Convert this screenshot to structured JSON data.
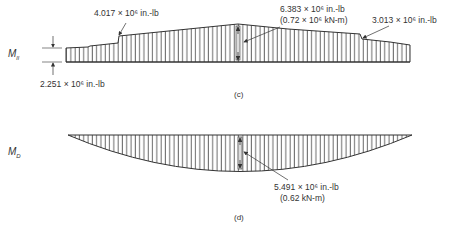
{
  "diagram_c": {
    "caption": "(c)",
    "symbol": "M",
    "symbol_sub": "ll",
    "labels": {
      "step_left": "4.017 × 10⁶ in.-lb",
      "end_left": "2.251 × 10⁶ in.-lb",
      "peak_line1": "6.383 × 10⁶ in.-lb",
      "peak_line2": "(0.72 × 10⁶ kN-m)",
      "step_right": "3.013 × 10⁶ in.-lb"
    }
  },
  "diagram_d": {
    "caption": "(d)",
    "symbol": "M",
    "symbol_sub": "D",
    "labels": {
      "peak_line1": "5.491 × 10⁶ in.-lb",
      "peak_line2": "(0.62 kN-m)"
    }
  }
}
